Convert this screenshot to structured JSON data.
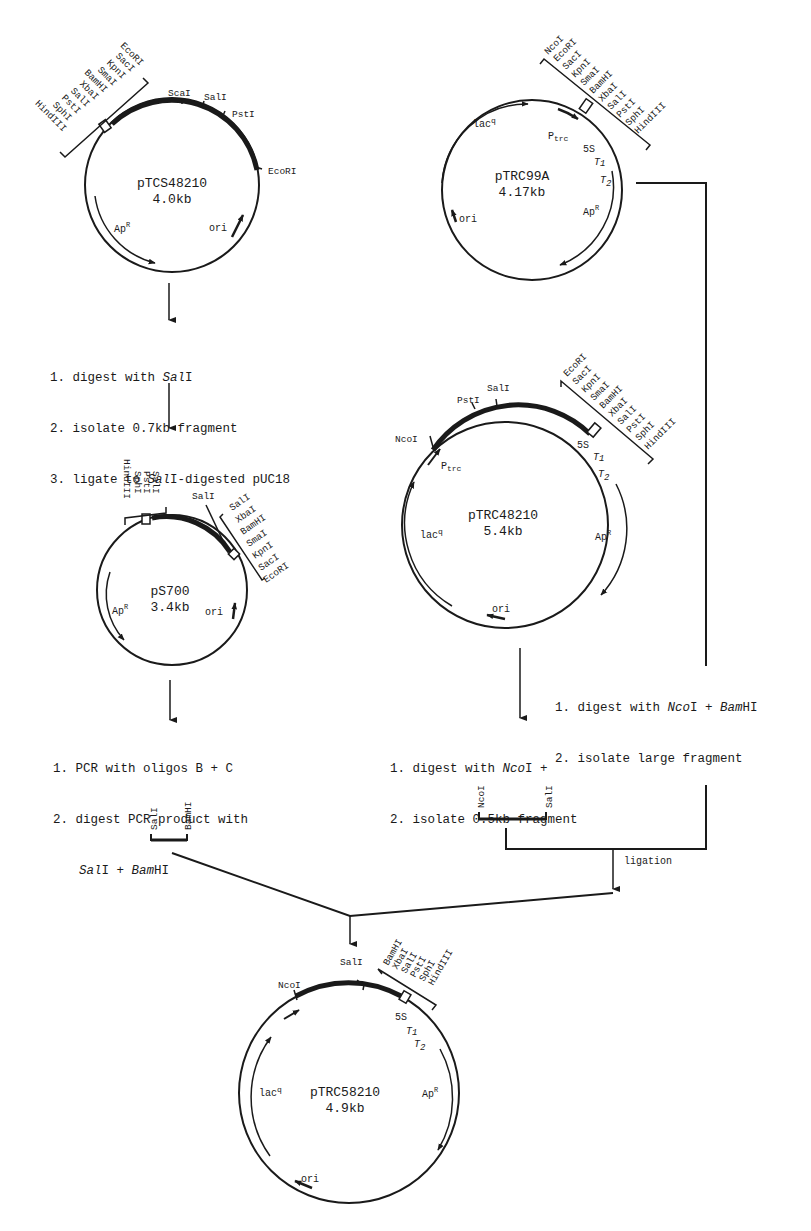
{
  "plasmids": {
    "ptcs48210": {
      "name": "pTCS48210",
      "size": "4.0kb",
      "mcs": [
        "EcoRI",
        "SacI",
        "KpnI",
        "SmaI",
        "BamHI",
        "XbaI",
        "SalI",
        "PstI",
        "SphI",
        "HindIII"
      ],
      "sites": {
        "scai": "ScaI",
        "sali": "SalI",
        "psti": "PstI",
        "ecori": "EcoRI"
      },
      "features": {
        "apr": "Ap",
        "apr_sup": "R",
        "ori": "ori"
      }
    },
    "ptrc99a": {
      "name": "pTRC99A",
      "size": "4.17kb",
      "mcs": [
        "NcoI",
        "EcoRI",
        "SacI",
        "KpnI",
        "SmaI",
        "BamHI",
        "XbaI",
        "SalI",
        "PstI",
        "SphI",
        "HindIII"
      ],
      "features": {
        "lacq": "lac",
        "lacq_sup": "q",
        "ptrc": "P",
        "ptrc_sub": "trc",
        "s5": "5S",
        "t1": "T",
        "t1_sub": "1",
        "t2": "T",
        "t2_sub": "2",
        "apr": "Ap",
        "apr_sup": "R",
        "ori": "ori"
      }
    },
    "ps700": {
      "name": "pS700",
      "size": "3.4kb",
      "mcs_left": [
        "SalI",
        "PstI",
        "SphI",
        "HindIII"
      ],
      "mcs_right": [
        "SalI",
        "XbaI",
        "BamHI",
        "SmaI",
        "KpnI",
        "SacI",
        "EcoRI"
      ],
      "sites": {
        "sali": "SalI"
      },
      "features": {
        "apr": "Ap",
        "apr_sup": "R",
        "ori": "ori"
      }
    },
    "ptrc48210": {
      "name": "pTRC48210",
      "size": "5.4kb",
      "mcs": [
        "EcoRI",
        "SacI",
        "KpnI",
        "SmaI",
        "BamHI",
        "XbaI",
        "SalI",
        "PstI",
        "SphI",
        "HindIII"
      ],
      "sites": {
        "ncoi": "NcoI",
        "psti": "PstI",
        "sali": "SalI"
      },
      "features": {
        "lacq": "lac",
        "lacq_sup": "q",
        "ptrc": "P",
        "ptrc_sub": "trc",
        "s5": "5S",
        "t1": "T",
        "t1_sub": "1",
        "t2": "T",
        "t2_sub": "2",
        "apr": "Ap",
        "apr_sup": "R",
        "ori": "ori"
      }
    },
    "ptrc58210": {
      "name": "pTRC58210",
      "size": "4.9kb",
      "mcs": [
        "BamHI",
        "XbaI",
        "SalI",
        "PstI",
        "SphI",
        "HindIII"
      ],
      "sites": {
        "ncoi": "NcoI",
        "sali": "SalI"
      },
      "features": {
        "lacq": "lac",
        "lacq_sup": "q",
        "s5": "5S",
        "t1": "T",
        "t1_sub": "1",
        "t2": "T",
        "t2_sub": "2",
        "apr": "Ap",
        "apr_sup": "R",
        "ori": "ori"
      }
    }
  },
  "steps": {
    "step_a": {
      "l1_pre": "1. digest with ",
      "l1_it": "Sal",
      "l1_post": "I",
      "l2": "2. isolate 0.7kb fragment",
      "l3_pre": "3. ligate to ",
      "l3_it": "Sal",
      "l3_post": "I-digested pUC18"
    },
    "step_b": {
      "l1": "1. PCR with oligos B + C",
      "l2": "2. digest PCR product with",
      "l3_it1": "Sal",
      "l3_mid": "I + ",
      "l3_it2": "Bam",
      "l3_post": "HI"
    },
    "step_c": {
      "l1_pre": "1. digest with ",
      "l1_it1": "Nco",
      "l1_mid": "I + ",
      "l1_it2": "Sal",
      "l1_post": "I",
      "l2": "2. isolate 0.5kb fragment"
    },
    "step_d": {
      "l1_pre": "1. digest with ",
      "l1_it1": "Nco",
      "l1_mid": "I + ",
      "l1_it2": "Bam",
      "l1_post": "HI",
      "l2": "2. isolate large fragment"
    },
    "ligation": "ligation"
  },
  "fragments": {
    "pcr_fragment": {
      "left": "SalI",
      "right": "BamHI"
    },
    "ncoi_sali_fragment": {
      "left": "NcoI",
      "right": "SalI"
    }
  }
}
